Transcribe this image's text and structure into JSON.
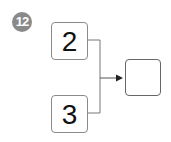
{
  "badge": {
    "number": "12",
    "color": "#8a8a8a"
  },
  "inputs": [
    {
      "value": "2"
    },
    {
      "value": "3"
    }
  ],
  "result": {
    "value": ""
  },
  "connector": {
    "type": "merge-arrow",
    "color": "#555555"
  }
}
